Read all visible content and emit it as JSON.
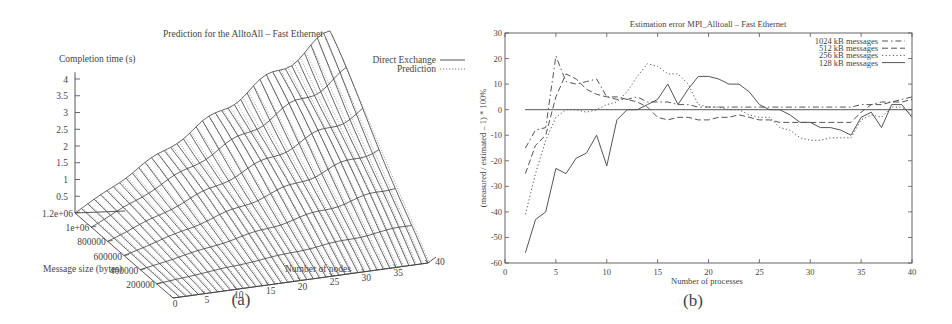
{
  "chart_data": [
    {
      "panel": "(a)",
      "type": "surface3d",
      "title": "Prediction for the AlltoAll – Fast Ethernet",
      "xlabel": "Number of nodes",
      "ylabel": "Message size (bytes)",
      "zlabel": "Completion time (s)",
      "x_ticks": [
        "0",
        "5",
        "10",
        "15",
        "20",
        "25",
        "30",
        "35",
        "40"
      ],
      "y_ticks": [
        "200000",
        "400000",
        "600000",
        "800000",
        "1e+06",
        "1.2e+06"
      ],
      "z_ticks": [
        "0.5",
        "1",
        "1.5",
        "2",
        "2.5",
        "3",
        "3.5",
        "4"
      ],
      "xlim": [
        0,
        40
      ],
      "ylim": [
        0,
        1200000
      ],
      "zlim": [
        0,
        4.2
      ],
      "legend": [
        {
          "name": "Direct Exchange",
          "style": "solid"
        },
        {
          "name": "Prediction",
          "style": "dotted"
        }
      ],
      "model": "completion_time ≈ k * nodes * message_size; max ≈ 4.3 s at 40 nodes, 1.2e+06 bytes",
      "series_edges": {
        "nodes_40_back_edge_time_s": 4.3,
        "nodes_0_time_s": 0.0
      }
    },
    {
      "panel": "(b)",
      "type": "line",
      "title": "Estimation error MPI_Alltoall – Fast Ethernet",
      "xlabel": "Number of processes",
      "ylabel": "(measured / estimated – 1) * 100%",
      "xlim": [
        0,
        40
      ],
      "ylim": [
        -60,
        30
      ],
      "x_ticks": [
        "0",
        "5",
        "10",
        "15",
        "20",
        "25",
        "30",
        "35",
        "40"
      ],
      "y_ticks": [
        "30",
        "20",
        "10",
        "0",
        "-10",
        "-20",
        "-30",
        "-40",
        "-50",
        "-60"
      ],
      "grid": false,
      "legend_position": "top-right",
      "x": [
        2,
        3,
        4,
        5,
        6,
        7,
        8,
        9,
        10,
        11,
        12,
        13,
        14,
        15,
        16,
        17,
        18,
        19,
        20,
        21,
        22,
        23,
        24,
        25,
        26,
        27,
        28,
        29,
        30,
        31,
        32,
        33,
        34,
        35,
        36,
        37,
        38,
        39,
        40
      ],
      "series": [
        {
          "name": "1024 kB messages",
          "style": "dashdot",
          "values": [
            -15,
            -8,
            -7,
            21,
            11,
            10,
            11,
            12,
            5,
            4,
            4,
            5,
            3,
            3,
            3,
            2,
            2,
            1,
            1,
            1,
            1,
            1,
            1,
            1,
            1,
            1,
            1,
            1,
            1,
            1,
            1,
            1,
            1,
            2,
            2,
            3,
            3,
            4,
            5
          ]
        },
        {
          "name": "512 kB messages",
          "style": "dashed",
          "values": [
            -25,
            -14,
            -10,
            5,
            14,
            12,
            8,
            6,
            5,
            5,
            4,
            3,
            1,
            -3,
            -4,
            -3,
            -3,
            -4,
            -4,
            -3,
            -3,
            -2,
            -3,
            -4,
            -4,
            -5,
            -5,
            -5,
            -5,
            -5,
            -5,
            -5,
            -5,
            -1,
            2,
            2,
            3,
            3,
            4
          ]
        },
        {
          "name": "256 kB messages",
          "style": "dotted",
          "values": [
            -41,
            -25,
            -12,
            -3,
            0,
            0,
            -1,
            0,
            2,
            3,
            7,
            13,
            18,
            17,
            14,
            14,
            10,
            2,
            1,
            1,
            0,
            0,
            -2,
            -3,
            -3,
            -7,
            -8,
            -11,
            -12,
            -12,
            -11,
            -11,
            -11,
            -4,
            -2,
            -3,
            1,
            1,
            -2
          ]
        },
        {
          "name": "128 kB messages",
          "style": "solid",
          "values": [
            -56,
            -43,
            -40,
            -23,
            -25,
            -19,
            -17,
            -10,
            -22,
            -4,
            0,
            0,
            2,
            4,
            10,
            2,
            8,
            13,
            13,
            12,
            10,
            10,
            7,
            2,
            0,
            0,
            -2,
            -5,
            -5,
            -7,
            -7,
            -8,
            -10,
            -3,
            -1,
            -7,
            2,
            2,
            -3
          ]
        }
      ]
    }
  ],
  "labels": {
    "a": {
      "title": "Prediction for the AlltoAll – Fast Ethernet",
      "zlabel": "Completion time (s)",
      "ylabel": "Message size (bytes)",
      "xlabel": "Number of nodes",
      "legend1": "Direct Exchange",
      "legend2": "Prediction",
      "caption": "(a)"
    },
    "b": {
      "title": "Estimation error MPI_Alltoall – Fast Ethernet",
      "ylabel": "(measured / estimated – 1) * 100%",
      "xlabel": "Number of processes",
      "caption": "(b)"
    }
  }
}
